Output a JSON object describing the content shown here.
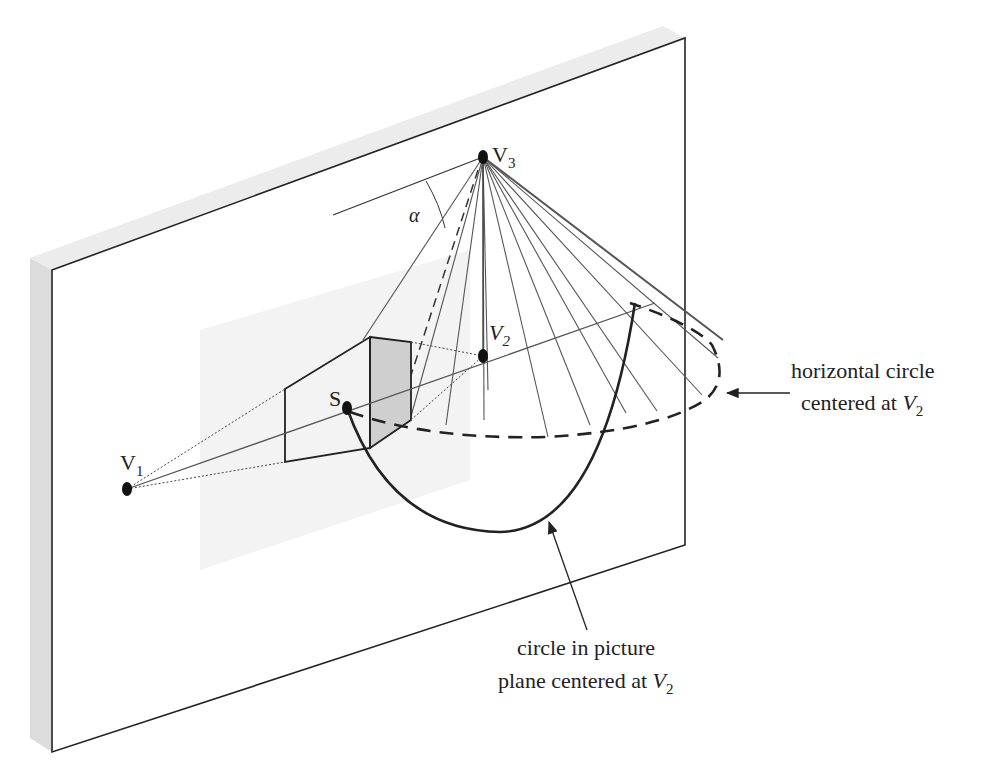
{
  "diagram": {
    "points": {
      "V1": {
        "label": "V",
        "sub": "1"
      },
      "V2": {
        "label": "V",
        "sub": "2"
      },
      "V3": {
        "label": "V",
        "sub": "3"
      },
      "S": {
        "label": "S"
      }
    },
    "angle_label": "α",
    "annotations": {
      "horizontal_circle": {
        "line1": "horizontal circle",
        "line2_prefix": "centered at ",
        "line2_var": "V",
        "line2_sub": "2"
      },
      "picture_circle": {
        "line1": "circle in picture",
        "line2_prefix": "plane centered at ",
        "line2_var": "V",
        "line2_sub": "2"
      }
    },
    "colors": {
      "ink": "#222222",
      "panel_edge": "#d8d8d8",
      "shaded_face": "#cfcfcf",
      "ray": "#555555"
    }
  }
}
